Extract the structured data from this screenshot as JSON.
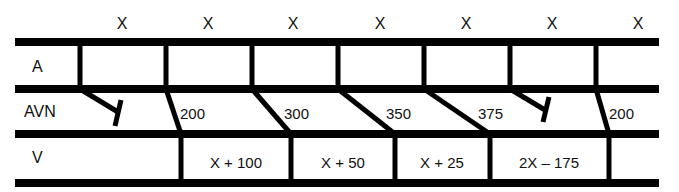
{
  "diagram": {
    "type": "ladder-diagram",
    "colors": {
      "line": "#000000",
      "background": "#ffffff",
      "text": "#111111"
    },
    "rows": [
      {
        "id": "A",
        "label": "A"
      },
      {
        "id": "AVN",
        "label": "AVN"
      },
      {
        "id": "V",
        "label": "V"
      }
    ],
    "atrial_intervals": [
      "X",
      "X",
      "X",
      "X",
      "X",
      "X",
      "X"
    ],
    "avn_conduction": [
      {
        "index": 0,
        "type": "blocked",
        "label": ""
      },
      {
        "index": 1,
        "type": "conducted",
        "label": "200"
      },
      {
        "index": 2,
        "type": "conducted",
        "label": "300"
      },
      {
        "index": 3,
        "type": "conducted",
        "label": "350"
      },
      {
        "index": 4,
        "type": "conducted",
        "label": "375"
      },
      {
        "index": 5,
        "type": "blocked",
        "label": ""
      },
      {
        "index": 6,
        "type": "conducted",
        "label": "200"
      }
    ],
    "ventricular_intervals": [
      "X + 100",
      "X + 50",
      "X + 25",
      "2X – 175"
    ]
  }
}
